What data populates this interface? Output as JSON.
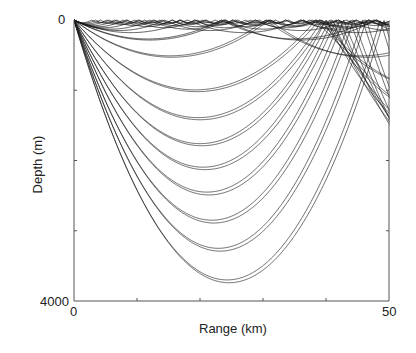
{
  "chart_data": {
    "type": "line",
    "title": "",
    "xlabel": "Range (km)",
    "ylabel": "Depth (m)",
    "xlim": [
      0,
      50
    ],
    "ylim": [
      0,
      4000
    ],
    "y_inverted": true,
    "x_tick_labels": [
      "0",
      "50"
    ],
    "y_tick_labels": [
      "0",
      "4000"
    ],
    "x_minor_ticks": [
      10,
      20,
      30,
      40
    ],
    "y_minor_ticks": [
      1000,
      2000,
      3000
    ],
    "grid": false,
    "legend": null,
    "source": {
      "range_km": 0,
      "depth_m": 0
    },
    "rays": [
      {
        "apex_depth_m": 3740,
        "apex_range_km": 24.6
      },
      {
        "apex_depth_m": 3700,
        "apex_range_km": 24.3
      },
      {
        "apex_depth_m": 3290,
        "apex_range_km": 23.2
      },
      {
        "apex_depth_m": 3250,
        "apex_range_km": 22.9
      },
      {
        "apex_depth_m": 2890,
        "apex_range_km": 22.2
      },
      {
        "apex_depth_m": 2850,
        "apex_range_km": 21.9
      },
      {
        "apex_depth_m": 2490,
        "apex_range_km": 21.4
      },
      {
        "apex_depth_m": 2450,
        "apex_range_km": 21.1
      },
      {
        "apex_depth_m": 2130,
        "apex_range_km": 20.8
      },
      {
        "apex_depth_m": 2095,
        "apex_range_km": 20.5
      },
      {
        "apex_depth_m": 1790,
        "apex_range_km": 20.3
      },
      {
        "apex_depth_m": 1760,
        "apex_range_km": 20.0
      },
      {
        "apex_depth_m": 1420,
        "apex_range_km": 20.0
      },
      {
        "apex_depth_m": 1390,
        "apex_range_km": 19.7
      },
      {
        "apex_depth_m": 1020,
        "apex_range_km": 19.5
      },
      {
        "apex_depth_m": 995,
        "apex_range_km": 19.2
      },
      {
        "apex_depth_m": 530,
        "apex_range_km": 15.5
      },
      {
        "apex_depth_m": 510,
        "apex_range_km": 15.2
      },
      {
        "apex_depth_m": 285,
        "apex_range_km": 12.0
      },
      {
        "apex_depth_m": 270,
        "apex_range_km": 11.7
      },
      {
        "apex_depth_m": 180,
        "apex_range_km": 9.0
      },
      {
        "apex_depth_m": 150,
        "apex_range_km": 7.2
      },
      {
        "apex_depth_m": 130,
        "apex_range_km": 6.0
      },
      {
        "apex_depth_m": 110,
        "apex_range_km": 4.8
      },
      {
        "apex_depth_m": 95,
        "apex_range_km": 3.9
      },
      {
        "apex_depth_m": 80,
        "apex_range_km": 3.2
      },
      {
        "apex_depth_m": 65,
        "apex_range_km": 2.6
      },
      {
        "apex_depth_m": 55,
        "apex_range_km": 2.1
      },
      {
        "apex_depth_m": 45,
        "apex_range_km": 1.7
      },
      {
        "apex_depth_m": 38,
        "apex_range_km": 1.4
      }
    ]
  },
  "axes": {
    "x_label": "Range (km)",
    "y_label": "Depth (m)",
    "x_min_label": "0",
    "x_max_label": "50",
    "y_min_label": "0",
    "y_max_label": "4000"
  },
  "style": {
    "ray_color": "#1a1a1a",
    "axis_color": "#555555"
  }
}
